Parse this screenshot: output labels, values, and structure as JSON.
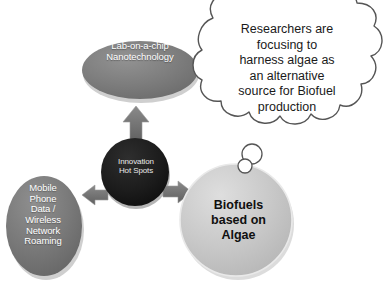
{
  "diagram": {
    "background_color": "#ffffff",
    "nodes": {
      "center": {
        "name": "Innovation Hot Spots",
        "text": "Innovation\nHot Spots",
        "shape": "circle",
        "fill_color": "#1c1c1c",
        "text_color": "#e8e8e8"
      },
      "top": {
        "name": "Lab-on-a-chip Nanotechnology",
        "text": "Lab-on-a-chip\nNanotechnology",
        "shape": "ellipse",
        "fill_color": "#7d7d7d",
        "text_color": "#ffffff"
      },
      "left": {
        "name": "Mobile Phone Data / Wireless Network Roaming",
        "text": "Mobile\nPhone\nData /\nWireless\nNetwork\nRoaming",
        "shape": "ellipse",
        "fill_color": "#7a7a7a",
        "text_color": "#ffffff"
      },
      "right": {
        "name": "Biofuels based on Algae",
        "text": "Biofuels\nbased on\nAlgae",
        "shape": "circle",
        "fill_color": "#c5c5c5",
        "text_color": "#101010"
      }
    },
    "callout": {
      "name": "thought-cloud",
      "text": "Researchers are\nfocusing to\nharness algae as\nan alternative\nsource for Biofuel\nproduction",
      "shape": "thought-cloud",
      "fill_color": "#ffffff",
      "stroke_color": "#555555"
    },
    "arrows": [
      {
        "name": "arrow-up-to-lab-on-a-chip",
        "direction": "up",
        "color": "#6f6f6f"
      },
      {
        "name": "arrow-left-to-mobile-phone",
        "direction": "left",
        "color": "#6f6f6f"
      },
      {
        "name": "arrow-right-to-biofuels",
        "direction": "right",
        "color": "#6f6f6f"
      }
    ]
  }
}
